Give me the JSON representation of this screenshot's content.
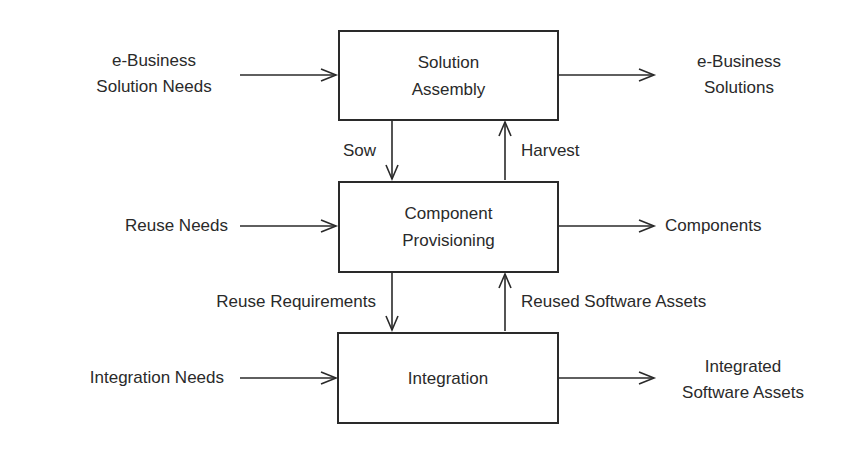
{
  "diagram": {
    "type": "block-flow",
    "stroke_color": "#2a2a2a",
    "background": "#ffffff",
    "nodes": [
      {
        "id": "solution_assembly",
        "line1": "Solution",
        "line2": "Assembly"
      },
      {
        "id": "component_provisioning",
        "line1": "Component",
        "line2": "Provisioning"
      },
      {
        "id": "integration",
        "line1": "Integration"
      }
    ],
    "inputs": {
      "solution_assembly": {
        "line1": "e-Business",
        "line2": "Solution Needs"
      },
      "component_provisioning": {
        "line1": "Reuse Needs"
      },
      "integration": {
        "line1": "Integration Needs"
      }
    },
    "outputs": {
      "solution_assembly": {
        "line1": "e-Business",
        "line2": "Solutions"
      },
      "component_provisioning": {
        "line1": "Components"
      },
      "integration": {
        "line1": "Integrated",
        "line2": "Software Assets"
      }
    },
    "vertical_flows": {
      "sow": "Sow",
      "harvest": "Harvest",
      "reuse_requirements": "Reuse Requirements",
      "reused_software_assets": "Reused Software Assets"
    }
  }
}
